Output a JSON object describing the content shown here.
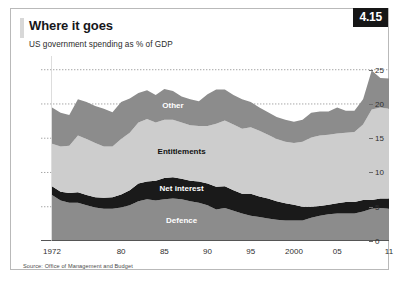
{
  "figure": {
    "number_badge": "4.15",
    "title": "Where it goes",
    "subtitle": "US government spending as % of GDP",
    "source": "Source: Office of Management and Budget"
  },
  "colors": {
    "other": "#8c8c8c",
    "entitlements": "#cdcdcd",
    "net_interest": "#1a1a1a",
    "defence": "#8c8c8c",
    "badge_bg": "#161616",
    "frame": "#b9b9b9",
    "gridline": "#8f8f8f",
    "axis": "#555555"
  },
  "chart_data": {
    "type": "area",
    "stacked": true,
    "title": "Where it goes",
    "subtitle": "US government spending as % of GDP",
    "xlabel": "",
    "ylabel": "% of GDP",
    "ylim": [
      0,
      27
    ],
    "yticks": [
      0,
      5,
      10,
      15,
      20,
      25
    ],
    "ytick_labels": [
      "0",
      "5",
      "10",
      "15",
      "20",
      "25"
    ],
    "xlim": [
      1972,
      2011
    ],
    "xticks": [
      1972,
      1980,
      1985,
      1990,
      1995,
      2000,
      2005,
      2011
    ],
    "xtick_labels": [
      "1972",
      "80",
      "85",
      "90",
      "95",
      "2000",
      "05",
      "11"
    ],
    "grid": "horizontal-dotted",
    "legend": "inline-band-labels",
    "x": [
      1972,
      1973,
      1974,
      1975,
      1976,
      1977,
      1978,
      1979,
      1980,
      1981,
      1982,
      1983,
      1984,
      1985,
      1986,
      1987,
      1988,
      1989,
      1990,
      1991,
      1992,
      1993,
      1994,
      1995,
      1996,
      1997,
      1998,
      1999,
      2000,
      2001,
      2002,
      2003,
      2004,
      2005,
      2006,
      2007,
      2008,
      2009,
      2010,
      2011
    ],
    "series": [
      {
        "name": "Defence",
        "color": "#8c8c8c",
        "values": [
          6.7,
          5.9,
          5.6,
          5.6,
          5.2,
          4.9,
          4.7,
          4.7,
          4.9,
          5.2,
          5.8,
          6.1,
          5.9,
          6.1,
          6.2,
          6.1,
          5.8,
          5.6,
          5.2,
          4.6,
          4.8,
          4.4,
          4.0,
          3.7,
          3.5,
          3.3,
          3.1,
          3.0,
          3.0,
          3.0,
          3.4,
          3.7,
          3.9,
          4.0,
          4.0,
          4.0,
          4.3,
          4.7,
          4.8,
          4.7
        ]
      },
      {
        "name": "Net interest",
        "color": "#1a1a1a",
        "values": [
          1.3,
          1.3,
          1.4,
          1.5,
          1.5,
          1.5,
          1.6,
          1.7,
          1.9,
          2.2,
          2.6,
          2.6,
          2.9,
          3.1,
          3.1,
          3.0,
          3.0,
          3.1,
          3.2,
          3.3,
          3.2,
          3.0,
          2.9,
          3.2,
          3.0,
          2.9,
          2.7,
          2.5,
          2.3,
          2.0,
          1.6,
          1.4,
          1.4,
          1.5,
          1.7,
          1.7,
          1.7,
          1.3,
          1.4,
          1.5
        ]
      },
      {
        "name": "Entitlements",
        "color": "#cdcdcd",
        "values": [
          6.2,
          6.6,
          6.9,
          8.3,
          8.2,
          7.9,
          7.5,
          7.4,
          8.1,
          8.4,
          8.9,
          9.1,
          8.5,
          8.5,
          8.4,
          8.2,
          8.1,
          8.1,
          8.4,
          9.2,
          9.6,
          9.6,
          9.5,
          9.7,
          9.6,
          9.3,
          9.1,
          9.0,
          9.0,
          9.5,
          10.1,
          10.3,
          10.2,
          10.2,
          10.1,
          10.2,
          11.0,
          13.2,
          13.3,
          13.1
        ]
      },
      {
        "name": "Other",
        "color": "#8c8c8c",
        "values": [
          5.3,
          4.9,
          4.5,
          5.3,
          5.4,
          5.4,
          5.5,
          5.0,
          5.4,
          5.0,
          4.3,
          4.2,
          4.0,
          4.5,
          4.2,
          3.8,
          3.8,
          3.6,
          4.6,
          5.0,
          4.5,
          4.3,
          4.3,
          3.7,
          3.4,
          3.3,
          3.2,
          3.2,
          3.1,
          3.2,
          3.6,
          3.5,
          3.4,
          3.8,
          3.2,
          3.1,
          3.7,
          5.7,
          4.3,
          4.4
        ]
      }
    ],
    "band_labels": [
      {
        "name": "Other",
        "text": "Other",
        "text_color": "#ffffff"
      },
      {
        "name": "Entitlements",
        "text": "Entitlements",
        "text_color": "#111111"
      },
      {
        "name": "Net interest",
        "text": "Net interest",
        "text_color": "#ffffff"
      },
      {
        "name": "Defence",
        "text": "Defence",
        "text_color": "#ffffff"
      }
    ]
  }
}
